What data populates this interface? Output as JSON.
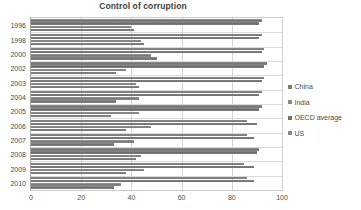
{
  "chart_data": {
    "type": "bar",
    "orientation": "horizontal",
    "title": "Control of corruption",
    "xlabel": "",
    "ylabel": "",
    "xlim": [
      0,
      100
    ],
    "xticks": [
      0,
      20,
      40,
      60,
      80,
      100
    ],
    "grid": true,
    "legend_position": "right",
    "categories": [
      "1996",
      "1998",
      "2000",
      "2002",
      "2003",
      "2004",
      "2005",
      "2006",
      "2007",
      "2008",
      "2009",
      "2010"
    ],
    "series": [
      {
        "name": "China",
        "color": "#7b7b7b",
        "values": [
          41,
          45,
          50,
          34,
          43,
          34,
          32,
          38,
          33,
          42,
          38,
          33
        ]
      },
      {
        "name": "India",
        "color": "#8a8a8a",
        "values": [
          40,
          44,
          48,
          38,
          42,
          43,
          43,
          48,
          41,
          44,
          45,
          36
        ]
      },
      {
        "name": "OECD average",
        "color": "#6f6f6f",
        "values": [
          91,
          91,
          92,
          93,
          92,
          91,
          91,
          90,
          89,
          90,
          89,
          89
        ]
      },
      {
        "name": "US",
        "color": "#858585",
        "values": [
          92,
          92,
          93,
          94,
          93,
          92,
          92,
          86,
          86,
          91,
          85,
          86
        ]
      }
    ]
  },
  "legend": {
    "items": [
      {
        "label": "China"
      },
      {
        "label": "India"
      },
      {
        "label": "OECD average"
      },
      {
        "label": "US"
      }
    ]
  }
}
